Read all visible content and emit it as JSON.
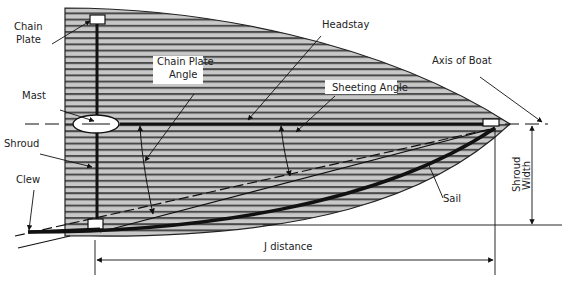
{
  "diagram": {
    "type": "sail-plan-top-view",
    "colors": {
      "fill": "#c8c8c8",
      "stripe": "#444444",
      "line": "#111111",
      "background": "#ffffff"
    },
    "labels": {
      "chain_plate": [
        "Chain",
        "Plate"
      ],
      "mast": "Mast",
      "shroud": "Shroud",
      "clew": "Clew",
      "chain_plate_angle": [
        "Chain Plate",
        "Angle"
      ],
      "headstay": "Headstay",
      "sheeting_angle": "Sheeting Angle",
      "axis_of_boat": "Axis of Boat",
      "sail": "Sail",
      "shroud_width": [
        "Shroud",
        "Width"
      ],
      "j_distance": "J distance"
    }
  }
}
